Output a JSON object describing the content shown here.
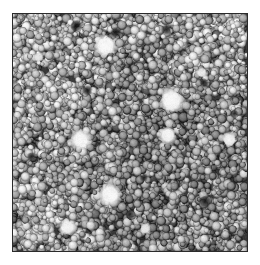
{
  "figure": {
    "kind": "micrograph",
    "modality": "scanning-electron-micrograph",
    "colorspace": "grayscale",
    "caption": "",
    "scalebar_text": "",
    "annotation_text": "",
    "page_background": "#ffffff",
    "frame": {
      "x": 12,
      "y": 13,
      "width": 236,
      "height": 239,
      "border_color": "#2b2b2b",
      "border_width": 1
    },
    "tone": {
      "background_gray": "#9d9d9d",
      "grain_light": "#d2d2d2",
      "grain_mid": "#a6a6a6",
      "grain_dark": "#6e6e6e",
      "boundary_dark": "#3a3a3a",
      "void_black": "#141414",
      "bright_white": "#f6f6f6",
      "min_gray": 10,
      "max_gray": 250,
      "mean_gray": 150
    },
    "texture": {
      "grain_count": 2600,
      "grain_radius_min": 2.4,
      "grain_radius_max": 5.4,
      "grain_radius_mean": 3.7,
      "boundary_width": 1.0,
      "noise_amplitude": 18,
      "seed": 20240517
    },
    "bright_inclusions": [
      {
        "label": "bright-particle-1",
        "cx": 0.395,
        "cy": 0.135,
        "r": 0.047,
        "peak": 252
      },
      {
        "label": "bright-particle-2",
        "cx": 0.678,
        "cy": 0.365,
        "r": 0.052,
        "peak": 250
      },
      {
        "label": "bright-particle-3",
        "cx": 0.288,
        "cy": 0.531,
        "r": 0.042,
        "peak": 249
      },
      {
        "label": "bright-particle-4",
        "cx": 0.662,
        "cy": 0.512,
        "r": 0.036,
        "peak": 247
      },
      {
        "label": "bright-particle-5",
        "cx": 0.925,
        "cy": 0.531,
        "r": 0.031,
        "peak": 243
      },
      {
        "label": "bright-particle-6",
        "cx": 0.415,
        "cy": 0.762,
        "r": 0.046,
        "peak": 251
      },
      {
        "label": "bright-particle-7",
        "cx": 0.233,
        "cy": 0.9,
        "r": 0.034,
        "peak": 244
      },
      {
        "label": "bright-particle-8",
        "cx": 0.806,
        "cy": 0.248,
        "r": 0.022,
        "peak": 234
      },
      {
        "label": "bright-particle-9",
        "cx": 0.11,
        "cy": 0.182,
        "r": 0.021,
        "peak": 230
      },
      {
        "label": "bright-particle-10",
        "cx": 0.565,
        "cy": 0.905,
        "r": 0.024,
        "peak": 233
      }
    ],
    "dark_voids": [
      {
        "label": "dark-void-1",
        "cx": 0.27,
        "cy": 0.05,
        "r": 0.03,
        "depth": 16
      },
      {
        "label": "dark-void-2",
        "cx": 0.44,
        "cy": 0.078,
        "r": 0.026,
        "depth": 20
      },
      {
        "label": "dark-void-3",
        "cx": 0.655,
        "cy": 0.066,
        "r": 0.024,
        "depth": 22
      },
      {
        "label": "dark-void-4",
        "cx": 0.816,
        "cy": 0.29,
        "r": 0.022,
        "depth": 26
      },
      {
        "label": "dark-void-5",
        "cx": 0.318,
        "cy": 0.322,
        "r": 0.025,
        "depth": 24
      },
      {
        "label": "dark-void-6",
        "cx": 0.82,
        "cy": 0.79,
        "r": 0.03,
        "depth": 18
      },
      {
        "label": "dark-void-7",
        "cx": 0.56,
        "cy": 0.69,
        "r": 0.02,
        "depth": 28
      },
      {
        "label": "dark-void-8",
        "cx": 0.078,
        "cy": 0.6,
        "r": 0.02,
        "depth": 30
      },
      {
        "label": "dark-void-9",
        "cx": 0.945,
        "cy": 0.42,
        "r": 0.02,
        "depth": 26
      },
      {
        "label": "dark-void-10",
        "cx": 0.5,
        "cy": 0.845,
        "r": 0.024,
        "depth": 24
      }
    ]
  }
}
